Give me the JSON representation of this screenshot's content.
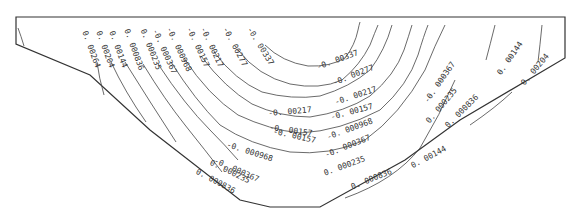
{
  "diagram": {
    "type": "contour-plot",
    "stroke_color": "#333333",
    "background": "#ffffff",
    "boundary_points": "16,17 565,17 565,58 460,120 405,160 320,207 270,207 240,200 150,130 90,75 16,44",
    "contours": [
      {
        "value": "0. 00264",
        "label": "0. 00264",
        "label_x": 86,
        "label_y": 30,
        "angle": 70,
        "path": "M18,30 Q22,40 24,48"
      },
      {
        "value": "0. 00264",
        "label": "0. 00264",
        "label_x": 86,
        "label_y": 30,
        "angle": 70,
        "path": "M97,60 Q100,78 103,92"
      },
      {
        "value": "0. 00204",
        "label": "0. 00204",
        "label_x": 102,
        "label_y": 30,
        "angle": 70,
        "path": "M110,60 Q125,90 146,120"
      },
      {
        "value": "0. 00144",
        "label": "0. 00144",
        "label_x": 114,
        "label_y": 30,
        "angle": 70,
        "path": "M125,60 Q150,100 176,140"
      },
      {
        "value": "0. 000836",
        "label": "0. 000836",
        "label_x": 130,
        "label_y": 30,
        "angle": 70,
        "path": "M144,64 Q170,105 200,145 Q215,160 225,178"
      },
      {
        "value": "0. 000235",
        "label": "0. 000235",
        "label_x": 146,
        "label_y": 30,
        "angle": 70,
        "path": "M160,64 Q190,110 215,135 Q230,150 240,165"
      },
      {
        "value": "0. 000367",
        "label": "-0. 000367",
        "label_x": 160,
        "label_y": 30,
        "angle": 65,
        "path": "M173,62 Q200,105 230,130 Q255,148 290,155 Q330,160 360,140 Q400,115 430,60 Q440,40 445,25"
      },
      {
        "value": "0. 000968",
        "label": "-0. 000968",
        "label_x": 175,
        "label_y": 27,
        "angle": 65,
        "path": "M186,58 Q210,95 240,115 Q270,130 300,133 Q340,130 380,110 Q410,85 420,55 Q426,35 430,25"
      },
      {
        "value": "0. 00157",
        "label": "-0. 00157",
        "label_x": 193,
        "label_y": 27,
        "angle": 65,
        "path": "M203,56 Q225,85 250,100 Q280,115 310,115 Q345,110 370,95 Q395,75 405,50 Q410,35 412,25"
      },
      {
        "value": "0. 00217",
        "label": "-0. 00217",
        "label_x": 205,
        "label_y": 25,
        "angle": 65,
        "path": "M215,52 Q235,78 260,88 Q290,98 320,94 Q350,85 370,70 Q385,50 392,25"
      },
      {
        "value": "0. 00277",
        "label": "-0. 00277",
        "label_x": 228,
        "label_y": 25,
        "angle": 65,
        "path": "M240,50 Q260,75 290,85 Q320,90 340,80 Q360,65 370,45 Q375,32 380,25"
      },
      {
        "value": "0. 00337",
        "label": "-0. 00337",
        "label_x": 253,
        "label_y": 25,
        "angle": 60,
        "path": "M268,45 Q285,62 310,65 Q330,66 345,58 Q355,45 358,30 Q359,25 360,22"
      },
      {
        "value": "0. 00144",
        "label": "0. 00144",
        "label_x": 500,
        "label_y": 68,
        "angle": -60,
        "path": "M495,25 Q490,45 485,58 M455,75 Q440,115 420,150 Q395,185 340,200"
      },
      {
        "value": "0. 00204",
        "label": "0. 00204",
        "label_x": 522,
        "label_y": 80,
        "angle": -60,
        "path": "M542,25 Q540,45 538,60 M510,90 Q490,110 470,125"
      }
    ],
    "labels": [
      {
        "text": "0. 00264",
        "x": 88,
        "y": 30,
        "angle": 70
      },
      {
        "text": "0. 00204",
        "x": 102,
        "y": 30,
        "angle": 70
      },
      {
        "text": "0. 00144",
        "x": 115,
        "y": 30,
        "angle": 70
      },
      {
        "text": "0. 000836",
        "x": 130,
        "y": 28,
        "angle": 70
      },
      {
        "text": "0. 000235",
        "x": 146,
        "y": 28,
        "angle": 68
      },
      {
        "text": "-0. 000367",
        "x": 158,
        "y": 28,
        "angle": 66
      },
      {
        "text": "-0. 000968",
        "x": 172,
        "y": 26,
        "angle": 65
      },
      {
        "text": "-0. 00157",
        "x": 192,
        "y": 26,
        "angle": 65
      },
      {
        "text": "-0. 00217",
        "x": 206,
        "y": 26,
        "angle": 65
      },
      {
        "text": "-0. 00277",
        "x": 228,
        "y": 26,
        "angle": 62
      },
      {
        "text": "-0. 00337",
        "x": 252,
        "y": 26,
        "angle": 58
      },
      {
        "text": "-0. 00337",
        "x": 316,
        "y": 64,
        "angle": -20
      },
      {
        "text": "-0. 00277",
        "x": 332,
        "y": 80,
        "angle": -22
      },
      {
        "text": "-0. 00217",
        "x": 334,
        "y": 99,
        "angle": -18
      },
      {
        "text": "-0. 00217",
        "x": 268,
        "y": 110,
        "angle": -5
      },
      {
        "text": "-0. 00157",
        "x": 330,
        "y": 114,
        "angle": -15
      },
      {
        "text": "-0. 00157",
        "x": 270,
        "y": 124,
        "angle": 8
      },
      {
        "text": "-0. 00157",
        "x": 274,
        "y": 128,
        "angle": 12
      },
      {
        "text": "-0. 000968",
        "x": 326,
        "y": 134,
        "angle": -20
      },
      {
        "text": "-0. 000968",
        "x": 228,
        "y": 141,
        "angle": 18
      },
      {
        "text": "-0. 000367",
        "x": 324,
        "y": 152,
        "angle": -22
      },
      {
        "text": "-0. 000367",
        "x": 216,
        "y": 157,
        "angle": 24
      },
      {
        "text": "0. 000235",
        "x": 212,
        "y": 159,
        "angle": 26
      },
      {
        "text": "0. 000235",
        "x": 323,
        "y": 170,
        "angle": -20
      },
      {
        "text": "0. 000836",
        "x": 198,
        "y": 168,
        "angle": 28
      },
      {
        "text": "0. 000836",
        "x": 350,
        "y": 184,
        "angle": -22
      },
      {
        "text": "0. 00144",
        "x": 410,
        "y": 163,
        "angle": -28
      },
      {
        "text": "-0. 000367",
        "x": 423,
        "y": 100,
        "angle": -55
      },
      {
        "text": "0. 000235",
        "x": 425,
        "y": 120,
        "angle": -50
      },
      {
        "text": "0. 000836",
        "x": 444,
        "y": 124,
        "angle": -45
      },
      {
        "text": "0. 00144",
        "x": 496,
        "y": 72,
        "angle": -55
      },
      {
        "text": "0. 00204",
        "x": 520,
        "y": 82,
        "angle": -50
      }
    ]
  }
}
